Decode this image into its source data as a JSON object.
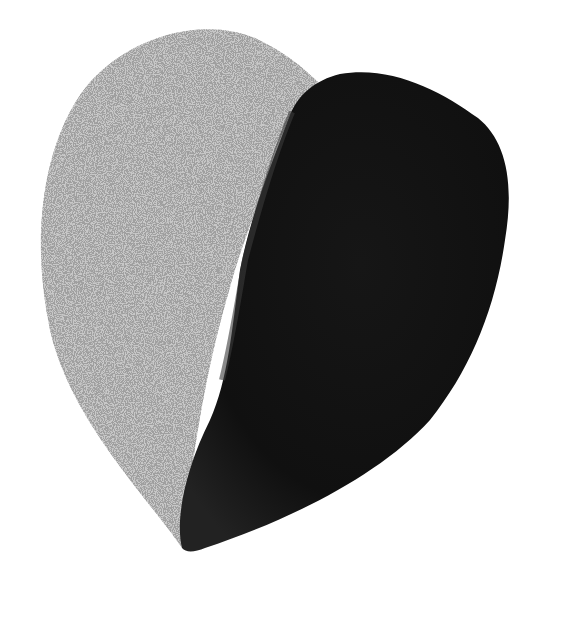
{
  "image": {
    "subject": "heart shape split into two halves",
    "background_color": "#ffffff",
    "left_half": {
      "material": "speckled light gray stone",
      "color": "#c9c9c9",
      "speckle_color": "#6a6a6a"
    },
    "right_half": {
      "material": "dark smooth stone",
      "color": "#111111",
      "highlight_color": "#2a2a2a"
    }
  }
}
